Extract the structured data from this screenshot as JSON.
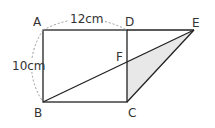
{
  "diagram": {
    "type": "geometry-figure",
    "points": {
      "A": {
        "label": "A",
        "x": 43,
        "y": 30
      },
      "B": {
        "label": "B",
        "x": 43,
        "y": 102
      },
      "C": {
        "label": "C",
        "x": 127,
        "y": 102
      },
      "D": {
        "label": "D",
        "x": 127,
        "y": 30
      },
      "E": {
        "label": "E",
        "x": 194,
        "y": 30
      },
      "F": {
        "label": "F",
        "x": 127,
        "y": 61
      }
    },
    "dimensions": {
      "top": "12cm",
      "left": "10cm"
    },
    "shaded_region": "triangle FCE",
    "colors": {
      "line": "#222222",
      "shade": "#e8e8e8",
      "dashed": "#999999"
    }
  }
}
